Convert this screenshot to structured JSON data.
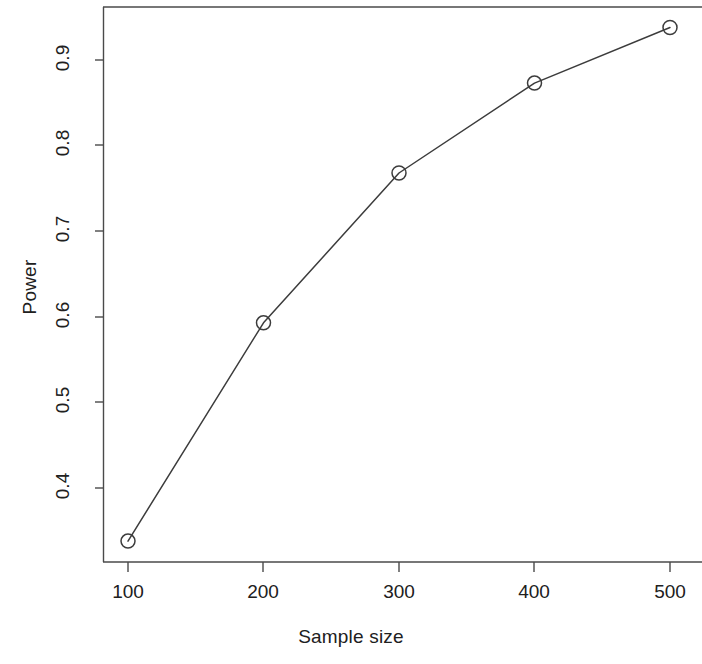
{
  "chart_data": {
    "type": "line",
    "title": "",
    "xlabel": "Sample size",
    "ylabel": "Power",
    "x": [
      100,
      200,
      300,
      400,
      500
    ],
    "values": [
      0.338,
      0.593,
      0.768,
      0.873,
      0.938
    ],
    "series": [
      {
        "name": "Power",
        "x": [
          100,
          200,
          300,
          400,
          500
        ],
        "values": [
          0.338,
          0.593,
          0.768,
          0.873,
          0.938
        ]
      }
    ],
    "xticks": [
      100,
      200,
      300,
      400,
      500
    ],
    "xtick_labels": [
      "100",
      "200",
      "300",
      "400",
      "500"
    ],
    "yticks": [
      0.4,
      0.5,
      0.6,
      0.7,
      0.8,
      0.9
    ],
    "ytick_labels": [
      "0.4",
      "0.5",
      "0.6",
      "0.7",
      "0.8",
      "0.9"
    ],
    "xlim": [
      82,
      530
    ],
    "ylim": [
      0.315,
      0.955
    ],
    "grid": false,
    "legend": null,
    "marker": "open-circle",
    "line_color": "#3c3c3c",
    "marker_color": "#3c3c3c",
    "background": "#ffffff"
  },
  "axes": {
    "x_title": "Sample size",
    "y_title": "Power"
  }
}
